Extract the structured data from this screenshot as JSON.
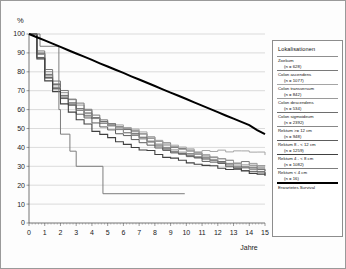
{
  "chart_data": {
    "type": "line",
    "title": "",
    "xlabel": "Jahre",
    "ylabel": "%",
    "xlim": [
      0,
      15
    ],
    "ylim": [
      0,
      100
    ],
    "xticks": [
      0,
      1,
      2,
      3,
      4,
      5,
      6,
      7,
      8,
      9,
      10,
      11,
      12,
      13,
      14,
      15
    ],
    "yticks": [
      0,
      10,
      20,
      30,
      40,
      50,
      60,
      70,
      80,
      90,
      100
    ],
    "grid": "horizontal",
    "legend_position": "right-outside",
    "legend_title": "Lokalisationen",
    "x": [
      0,
      0.5,
      1,
      1.5,
      2,
      2.5,
      3,
      3.5,
      4,
      4.5,
      5,
      5.5,
      6,
      6.5,
      7,
      7.5,
      8,
      8.5,
      9,
      9.5,
      10,
      10.5,
      11,
      11.5,
      12,
      12.5,
      13,
      13.5,
      14,
      14.5,
      15
    ],
    "series": [
      {
        "name": "Zoekum",
        "n": 628,
        "label_line1": "Zoekum",
        "label_line2": "(n = 628)",
        "color": "#8f8f8f",
        "width": 1.0,
        "values": [
          100,
          90,
          80,
          74,
          69,
          65,
          62,
          59,
          56,
          54,
          52,
          50,
          48,
          47,
          45,
          43,
          42,
          40,
          39,
          38,
          37,
          36,
          35,
          34,
          33,
          32,
          31,
          30,
          29,
          29,
          28
        ]
      },
      {
        "name": "Colon ascendens",
        "n": 1077,
        "label_line1": "Colon ascendens",
        "label_line2": "(n = 1077)",
        "color": "#7a7a7a",
        "width": 1.0,
        "values": [
          100,
          91,
          81,
          75,
          70,
          66,
          63,
          60,
          57,
          55,
          53,
          51,
          50,
          49,
          47,
          45,
          43,
          42,
          40,
          39,
          38,
          37,
          36,
          35,
          34,
          33,
          32,
          32,
          31,
          30,
          30
        ]
      },
      {
        "name": "Colon transversum",
        "n": 842,
        "label_line1": "Colon transversum",
        "label_line2": "(n = 842)",
        "color": "#a5a5a5",
        "width": 1.0,
        "values": [
          100,
          89,
          78,
          72,
          67,
          63,
          60,
          58,
          56,
          54,
          53,
          52,
          51,
          50,
          48,
          46,
          44,
          42,
          41,
          40,
          39,
          38,
          38,
          38,
          38,
          38,
          38,
          38,
          38,
          37,
          36
        ]
      },
      {
        "name": "Colon descendens",
        "n": 534,
        "label_line1": "Colon descendens",
        "label_line2": "(n = 534)",
        "color": "#9a9a9a",
        "width": 1.0,
        "values": [
          100,
          88,
          77,
          71,
          66,
          62,
          59,
          57,
          55,
          53,
          52,
          51,
          50,
          49,
          47,
          45,
          43,
          41,
          40,
          39,
          38,
          37,
          36,
          35,
          34,
          33,
          32,
          31,
          31,
          30,
          30
        ]
      },
      {
        "name": "Colon sigmoideum",
        "n": 2392,
        "label_line1": "Colon sigmoideum",
        "label_line2": "(n = 2392)",
        "color": "#6e6e6e",
        "width": 1.0,
        "values": [
          100,
          90,
          79,
          73,
          68,
          64,
          61,
          58,
          56,
          54,
          52,
          50,
          49,
          47,
          45,
          43,
          41,
          40,
          38,
          37,
          36,
          35,
          34,
          33,
          32,
          31,
          30,
          29,
          29,
          28,
          27
        ]
      },
      {
        "name": "Rektum >= 12 cm",
        "n": 948,
        "label_line1": "Rektum >= 12 cm",
        "label_line2": "(n = 948)",
        "color": "#888888",
        "width": 1.0,
        "values": [
          100,
          89,
          78,
          72,
          67,
          63,
          60,
          57,
          55,
          53,
          51,
          49,
          48,
          46,
          44,
          43,
          41,
          39,
          38,
          37,
          36,
          35,
          34,
          33,
          32,
          31,
          30,
          29,
          28,
          27,
          26
        ]
      },
      {
        "name": "Rektum 8 - < 12 cm",
        "n": 1259,
        "label_line1": "Rektum 8 - < 12 cm",
        "label_line2": "(n = 1259)",
        "color": "#5d5d5d",
        "width": 1.0,
        "values": [
          100,
          88,
          77,
          71,
          66,
          62,
          58,
          56,
          53,
          51,
          49,
          47,
          46,
          44,
          43,
          41,
          40,
          38,
          37,
          36,
          35,
          34,
          33,
          32,
          31,
          30,
          29,
          28,
          27,
          27,
          26
        ]
      },
      {
        "name": "Rektum 4 - < 8 cm",
        "n": 1082,
        "label_line1": "Rektum 4 - < 8 cm",
        "label_line2": "(n = 1082)",
        "color": "#404040",
        "width": 1.1,
        "values": [
          100,
          87,
          75,
          69,
          63,
          59,
          55,
          52,
          49,
          47,
          45,
          43,
          42,
          40,
          39,
          38,
          36,
          35,
          34,
          33,
          32,
          31,
          30,
          30,
          29,
          28,
          28,
          27,
          26,
          26,
          25
        ]
      },
      {
        "name": "Rektum < 4 cm",
        "n": 16,
        "label_line1": "Rektum < 4 cm",
        "label_line2": "(n = 16)",
        "color": "#7d7d7d",
        "width": 1.0,
        "step": true,
        "points": [
          [
            0,
            100
          ],
          [
            0.7,
            100
          ],
          [
            0.7,
            93.5
          ],
          [
            1.9,
            93.5
          ],
          [
            1.9,
            60
          ],
          [
            2.0,
            60
          ],
          [
            2.0,
            47
          ],
          [
            2.6,
            47
          ],
          [
            2.6,
            38
          ],
          [
            3.0,
            38
          ],
          [
            3.0,
            30
          ],
          [
            4.7,
            30
          ],
          [
            4.7,
            15.5
          ],
          [
            9.9,
            15.5
          ]
        ]
      },
      {
        "name": "Erwartetes Survival",
        "label_line1": "Erwartetes Survival",
        "label_line2": "",
        "color": "#000000",
        "width": 2.0,
        "expected": true,
        "values": [
          100,
          98.3,
          96.6,
          94.9,
          93.2,
          91.4,
          89.7,
          88,
          86.3,
          84.5,
          82.8,
          81.1,
          79.4,
          77.6,
          75.9,
          74.2,
          72.5,
          70.7,
          69,
          67.3,
          65.6,
          63.8,
          62.1,
          60.4,
          58.7,
          56.9,
          55.2,
          53.5,
          51.8,
          49.2,
          47
        ]
      }
    ]
  },
  "axes": {
    "y_unit": "%",
    "x_title": "Jahre",
    "y_tick_labels": [
      "100",
      "90",
      "80",
      "70",
      "60",
      "50",
      "40",
      "30",
      "20",
      "10",
      "0"
    ],
    "x_tick_labels": [
      "0",
      "1",
      "2",
      "3",
      "4",
      "5",
      "6",
      "7",
      "8",
      "9",
      "10",
      "11",
      "12",
      "13",
      "14",
      "15"
    ]
  },
  "legend": {
    "title": "Lokalisationen",
    "entries": [
      {
        "line1": "Zoekum",
        "line2": "(n = 628)",
        "color": "#8f8f8f",
        "width": 1.1
      },
      {
        "line1": "Colon ascendens",
        "line2": "(n = 1077)",
        "color": "#7a7a7a",
        "width": 1.1
      },
      {
        "line1": "Colon transversum",
        "line2": "(n = 842)",
        "color": "#a5a5a5",
        "width": 1.1
      },
      {
        "line1": "Colon descendens",
        "line2": "(n = 534)",
        "color": "#9a9a9a",
        "width": 1.1
      },
      {
        "line1": "Colon sigmoideum",
        "line2": "(n = 2392)",
        "color": "#6e6e6e",
        "width": 1.1
      },
      {
        "line1": "Rektum >= 12 cm",
        "line2": "(n = 948)",
        "color": "#888888",
        "width": 1.1
      },
      {
        "line1": "Rektum 8 - < 12 cm",
        "line2": "(n = 1259)",
        "color": "#5d5d5d",
        "width": 1.2
      },
      {
        "line1": "Rektum 4 - < 8 cm",
        "line2": "(n = 1082)",
        "color": "#404040",
        "width": 1.4
      },
      {
        "line1": "Rektum < 4 cm",
        "line2": "(n = 16)",
        "color": "#7d7d7d",
        "width": 1.1
      },
      {
        "line1": "Erwartetes Survival",
        "line2": "",
        "color": "#000000",
        "width": 2.0
      }
    ]
  }
}
